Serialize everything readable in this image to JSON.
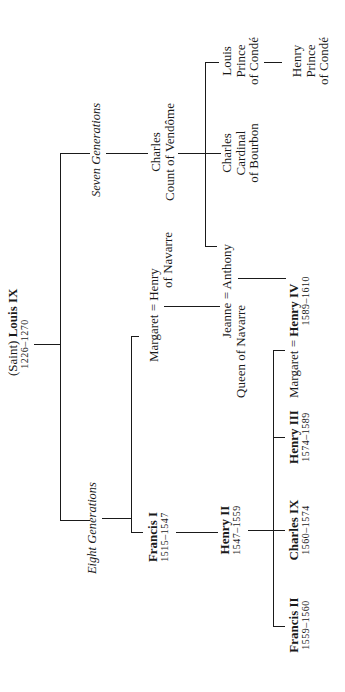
{
  "diagram": {
    "type": "genealogy-tree",
    "orientation": "rotated-90-ccw",
    "root": {
      "prefix": "(Saint)",
      "name": "Louis IX",
      "years": "1226–1270"
    },
    "branches": {
      "seven": {
        "label": "Seven Generations"
      },
      "eight": {
        "label": "Eight Generations"
      }
    },
    "charles_vendome": {
      "line1": "Charles",
      "line2": "Count of Vendôme"
    },
    "charles_cardinal": {
      "line1": "Charles",
      "line2": "Cardinal",
      "line3": "of Bourbon"
    },
    "louis_conde": {
      "line1": "Louis",
      "line2": "Prince",
      "line3": "of Condé"
    },
    "henry_conde": {
      "line1": "Henry",
      "line2": "Prince",
      "line3": "of Condé"
    },
    "jeanne_anthony": {
      "line1": "Jeanne = Anthony",
      "line2": "Queen of Navarre"
    },
    "margaret_henry_navarre": {
      "line1": "Margaret = Henry",
      "line2": "of Navarre"
    },
    "francis_i": {
      "name": "Francis I",
      "years": "1515–1547"
    },
    "henry_ii": {
      "name": "Henry II",
      "years": "1547–1559"
    },
    "francis_ii": {
      "name": "Francis II",
      "years": "1559–1560"
    },
    "charles_ix": {
      "name": "Charles IX",
      "years": "1560–1574"
    },
    "henry_iii": {
      "name": "Henry III",
      "years": "1574–1589"
    },
    "margaret_henry_iv": {
      "spouse": "Margaret = ",
      "name": "Henry IV",
      "years": "1589–1610"
    }
  }
}
